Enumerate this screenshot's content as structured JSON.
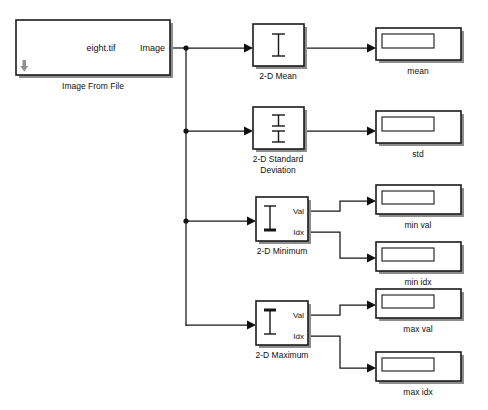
{
  "diagram": {
    "canvas": {
      "width": 488,
      "height": 410,
      "background": "#ffffff"
    },
    "line_color": "#161616",
    "block_fill": "#ffffff",
    "block_stroke": "#1b1b1b"
  },
  "source_block": {
    "name": "Image From File",
    "file_value": "eight.tif",
    "output_port_label": "Image",
    "icon": "down-arrow-icon"
  },
  "blocks": [
    {
      "id": "mean",
      "label": "2-D Mean",
      "icon": "i-beam-icon",
      "inputs": [
        "in"
      ],
      "outputs": [
        "out"
      ]
    },
    {
      "id": "std",
      "label": "2-D Standard\nDeviation",
      "label_line1": "2-D Standard",
      "label_line2": "Deviation",
      "icon": "double-i-beam-icon",
      "inputs": [
        "in"
      ],
      "outputs": [
        "out"
      ]
    },
    {
      "id": "minimum",
      "label": "2-D Minimum",
      "icon": "i-beam-bottom-heavy-icon",
      "inputs": [
        "in"
      ],
      "outputs": [
        "Val",
        "Idx"
      ],
      "port_val": "Val",
      "port_idx": "Idx"
    },
    {
      "id": "maximum",
      "label": "2-D Maximum",
      "icon": "i-beam-top-heavy-icon",
      "inputs": [
        "in"
      ],
      "outputs": [
        "Val",
        "Idx"
      ],
      "port_val": "Val",
      "port_idx": "Idx"
    }
  ],
  "displays": [
    {
      "id": "mean",
      "caption": "mean",
      "value": ""
    },
    {
      "id": "std",
      "caption": "std",
      "value": ""
    },
    {
      "id": "min_val",
      "caption": "min val",
      "value": ""
    },
    {
      "id": "min_idx",
      "caption": "min idx",
      "value": ""
    },
    {
      "id": "max_val",
      "caption": "max val",
      "value": ""
    },
    {
      "id": "max_idx",
      "caption": "max idx",
      "value": ""
    }
  ],
  "connections": [
    {
      "from": "Image From File.Image",
      "to": "2-D Mean.in"
    },
    {
      "from": "Image From File.Image",
      "to": "2-D Standard Deviation.in"
    },
    {
      "from": "Image From File.Image",
      "to": "2-D Minimum.in"
    },
    {
      "from": "Image From File.Image",
      "to": "2-D Maximum.in"
    },
    {
      "from": "2-D Mean.out",
      "to": "mean"
    },
    {
      "from": "2-D Standard Deviation.out",
      "to": "std"
    },
    {
      "from": "2-D Minimum.Val",
      "to": "min val"
    },
    {
      "from": "2-D Minimum.Idx",
      "to": "min idx"
    },
    {
      "from": "2-D Maximum.Val",
      "to": "max val"
    },
    {
      "from": "2-D Maximum.Idx",
      "to": "max idx"
    }
  ]
}
